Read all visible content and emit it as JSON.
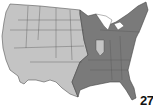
{
  "map": {
    "title": "United States map",
    "regions": [
      {
        "name": "western-region",
        "shade": "light",
        "color": "#c4c4c4"
      },
      {
        "name": "eastern-region",
        "shade": "dark",
        "color": "#7a7a7a"
      },
      {
        "name": "illinois-inset",
        "shade": "light",
        "color": "#c4c4c4"
      }
    ],
    "border_color": "#555555",
    "page_number": "27"
  }
}
